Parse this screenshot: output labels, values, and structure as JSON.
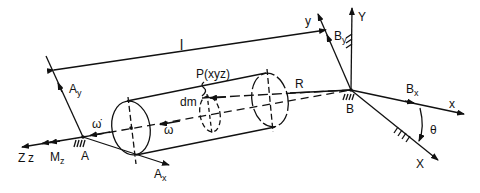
{
  "diagram": {
    "type": "mechanical free-body diagram of rotating cylinder on shaft",
    "labels": {
      "length": "l",
      "point": "P(xyz)",
      "mass_element": "dm",
      "radius": "R",
      "angular_velocity": "ω",
      "angular_acceleration": "ω̇",
      "support_A": "A",
      "support_B": "B",
      "axis_Z": "Z",
      "axis_z": "z",
      "moment": "M",
      "moment_sub": "z",
      "reaction_Ay": "A",
      "reaction_Ay_sub": "y",
      "reaction_Ax": "A",
      "reaction_Ax_sub": "x",
      "reaction_By": "B",
      "reaction_By_sub": "y",
      "reaction_Bx": "B",
      "reaction_Bx_sub": "x",
      "axis_y_rot": "y",
      "axis_Y_fixed": "Y",
      "axis_x_rot": "x",
      "axis_X_fixed": "X",
      "angle": "θ"
    },
    "colors": {
      "ink": "#111111",
      "background": "#ffffff"
    }
  }
}
